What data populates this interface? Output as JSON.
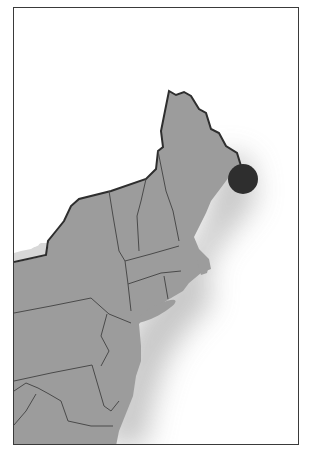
{
  "map": {
    "region": "Northeastern United States",
    "land_color": "#9c9c9c",
    "water_color": "#ffffff",
    "border_color": "#3a3a3a",
    "frame": {
      "x": 13,
      "y": 7,
      "width": 286,
      "height": 438
    },
    "marker": {
      "label": "",
      "shape": "circle",
      "color": "#2e2e2e",
      "center": {
        "x": 242,
        "y": 178
      },
      "radius": 15
    }
  }
}
